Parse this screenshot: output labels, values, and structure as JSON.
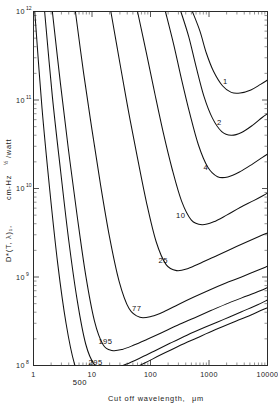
{
  "chart_data": {
    "type": "line",
    "title": "",
    "xlabel": "Cut off wavelength,   μm",
    "ylabel": "D*(T, λ)₁,  cm-Hz   /watt",
    "ylabel_parts": {
      "symbol": "D*(T, λ)₁,",
      "units_main": "cm-Hz",
      "units_exp": "½",
      "units_tail": "/watt"
    },
    "xscale": "log",
    "yscale": "log",
    "xlim": [
      1,
      10000
    ],
    "ylim": [
      100000000,
      1000000000000
    ],
    "grid": false,
    "legend": "inline curve labels",
    "xticklabels": [
      "1",
      "10",
      "100",
      "1000",
      "10000"
    ],
    "xtickvalues": [
      1,
      10,
      100,
      1000,
      10000
    ],
    "yticklabels": [
      "10",
      "10",
      "10",
      "10",
      "10"
    ],
    "ytickexponents": [
      "12",
      "11",
      "10",
      "9",
      "8"
    ],
    "ytickvalues": [
      1000000000000,
      100000000000,
      10000000000,
      1000000000,
      100000000
    ],
    "series_unit": "K",
    "series": [
      {
        "name": "1",
        "label": "1",
        "label_x": 1900,
        "label_y": 150000000000,
        "points": [
          [
            520,
            1000000000000
          ],
          [
            700,
            600000000000.0
          ],
          [
            900,
            340000000000.0
          ],
          [
            1200,
            210000000000.0
          ],
          [
            1700,
            145000000000.0
          ],
          [
            2400,
            122000000000.0
          ],
          [
            3400,
            120000000000.0
          ],
          [
            5200,
            130000000000.0
          ],
          [
            7600,
            150000000000.0
          ],
          [
            10000,
            168000000000.0
          ]
        ]
      },
      {
        "name": "2",
        "label": "2",
        "label_x": 1500,
        "label_y": 52000000000.0,
        "points": [
          [
            330,
            1000000000000
          ],
          [
            450,
            520000000000.0
          ],
          [
            600,
            240000000000.0
          ],
          [
            820,
            110000000000.0
          ],
          [
            1150,
            62000000000.0
          ],
          [
            1650,
            44000000000.0
          ],
          [
            2400,
            40000000000.0
          ],
          [
            3600,
            43000000000.0
          ],
          [
            5600,
            52000000000.0
          ],
          [
            8000,
            63000000000.0
          ],
          [
            10000,
            70000000000.0
          ]
        ]
      },
      {
        "name": "4",
        "label": "4",
        "label_x": 880,
        "label_y": 16200000000.0,
        "points": [
          [
            180,
            1000000000000
          ],
          [
            250,
            420000000000.0
          ],
          [
            340,
            170000000000.0
          ],
          [
            470,
            70000000000.0
          ],
          [
            660,
            31000000000.0
          ],
          [
            950,
            17500000000.0
          ],
          [
            1400,
            13600000000.0
          ],
          [
            2100,
            13500000000.0
          ],
          [
            3400,
            15500000000.0
          ],
          [
            5600,
            19000000000.0
          ],
          [
            8200,
            22500000000.0
          ],
          [
            10000,
            24500000000.0
          ]
        ]
      },
      {
        "name": "10",
        "label": "10",
        "label_x": 330,
        "label_y": 4600000000.0,
        "points": [
          [
            60,
            1000000000000
          ],
          [
            85,
            340000000000.0
          ],
          [
            118,
            120000000000.0
          ],
          [
            165,
            43000000000.0
          ],
          [
            235,
            16500000000.0
          ],
          [
            340,
            7200000000.0
          ],
          [
            500,
            4400000000.0
          ],
          [
            760,
            3900000000.0
          ],
          [
            1200,
            4200000000.0
          ],
          [
            2000,
            5000000000.0
          ],
          [
            3400,
            6100000000.0
          ],
          [
            5800,
            7300000000.0
          ],
          [
            8600,
            8400000000.0
          ],
          [
            10000,
            8900000000.0
          ]
        ]
      },
      {
        "name": "25",
        "label": "25",
        "label_x": 165,
        "label_y": 1450000000.0,
        "points": [
          [
            21,
            1000000000000
          ],
          [
            30,
            260000000000.0
          ],
          [
            42,
            75000000000.0
          ],
          [
            60,
            22000000000.0
          ],
          [
            86,
            6800000000.0
          ],
          [
            125,
            2500000000.0
          ],
          [
            185,
            1380000000.0
          ],
          [
            280,
            1180000000.0
          ],
          [
            440,
            1250000000.0
          ],
          [
            740,
            1450000000.0
          ],
          [
            1300,
            1720000000.0
          ],
          [
            2300,
            2050000000.0
          ],
          [
            4200,
            2450000000.0
          ],
          [
            7000,
            2850000000.0
          ],
          [
            10000,
            3150000000.0
          ]
        ]
      },
      {
        "name": "77",
        "label": "77",
        "label_x": 58,
        "label_y": 410000000.0,
        "points": [
          [
            5.2,
            1000000000000
          ],
          [
            7.2,
            200000000000.0
          ],
          [
            10,
            46000000000.0
          ],
          [
            14,
            11000000000.0
          ],
          [
            20,
            2800000000.0
          ],
          [
            29,
            900000000.0
          ],
          [
            43,
            440000000.0
          ],
          [
            66,
            350000000.0
          ],
          [
            105,
            360000000.0
          ],
          [
            175,
            410000000.0
          ],
          [
            300,
            490000000.0
          ],
          [
            540,
            590000000.0
          ],
          [
            1000,
            710000000.0
          ],
          [
            1900,
            850000000.0
          ],
          [
            3600,
            1000000000.0
          ],
          [
            6500,
            1180000000.0
          ],
          [
            10000,
            1320000000.0
          ]
        ]
      },
      {
        "name": "195",
        "label": "195",
        "label_x": 17,
        "label_y": 175000000.0,
        "points": [
          [
            2.1,
            1000000000000
          ],
          [
            2.9,
            150000000000.0
          ],
          [
            4.0,
            26000000000.0
          ],
          [
            5.6,
            4800000000.0
          ],
          [
            7.8,
            1050000000.0
          ],
          [
            11,
            320000000.0
          ],
          [
            15.5,
            172000000.0
          ],
          [
            22,
            148000000.0
          ],
          [
            33,
            152000000.0
          ],
          [
            52,
            170000000.0
          ],
          [
            88,
            198000000.0
          ],
          [
            155,
            235000000.0
          ],
          [
            290,
            285000000.0
          ],
          [
            560,
            345000000.0
          ],
          [
            1100,
            420000000.0
          ],
          [
            2200,
            510000000.0
          ],
          [
            4400,
            610000000.0
          ],
          [
            7500,
            700000000.0
          ],
          [
            10000,
            760000000.0
          ]
        ]
      },
      {
        "name": "295",
        "label": "295",
        "label_x": 11.5,
        "label_y": 102000000.0,
        "points": [
          [
            1.55,
            1000000000000
          ],
          [
            2.1,
            110000000000.0
          ],
          [
            2.9,
            16000000000.0
          ],
          [
            4.0,
            2600000000.0
          ],
          [
            5.6,
            540000000.0
          ],
          [
            7.8,
            175000000.0
          ],
          [
            11,
            102000000.0
          ],
          [
            16,
            90000000.0
          ],
          [
            24,
            93000000.0
          ],
          [
            38,
            103000000.0
          ],
          [
            64,
            120000000.0
          ],
          [
            115,
            145000000.0
          ],
          [
            215,
            178000000.0
          ],
          [
            420,
            220000000.0
          ],
          [
            850,
            270000000.0
          ],
          [
            1750,
            330000000.0
          ],
          [
            3600,
            405000000.0
          ],
          [
            6800,
            485000000.0
          ],
          [
            10000,
            550000000.0
          ]
        ]
      },
      {
        "name": "500",
        "label": "500",
        "label_x": 6.2,
        "label_y": 60000000.0,
        "points": [
          [
            1.05,
            1000000000000
          ],
          [
            1.4,
            80000000000.0
          ],
          [
            1.9,
            9500000000.0
          ],
          [
            2.6,
            1400000000.0
          ],
          [
            3.6,
            300000000.0
          ],
          [
            5.0,
            105000000.0
          ],
          [
            7.0,
            66000000.0
          ],
          [
            10,
            60000000.0
          ],
          [
            15,
            64000000.0
          ],
          [
            24,
            73000000.0
          ],
          [
            42,
            87000000.0
          ],
          [
            78,
            106000000.0
          ],
          [
            150,
            132000000.0
          ],
          [
            300,
            165000000.0
          ],
          [
            620,
            205000000.0
          ],
          [
            1300,
            255000000.0
          ],
          [
            2800,
            315000000.0
          ],
          [
            5600,
            380000000.0
          ],
          [
            10000,
            450000000.0
          ]
        ]
      }
    ]
  },
  "xaxis": {
    "title": "Cut off wavelength,",
    "unit": "μm"
  },
  "yaxis": {
    "symbol": "D*(T, λ)₁,",
    "units_main": "cm-Hz",
    "units_exp": "½",
    "units_tail": "/watt"
  }
}
